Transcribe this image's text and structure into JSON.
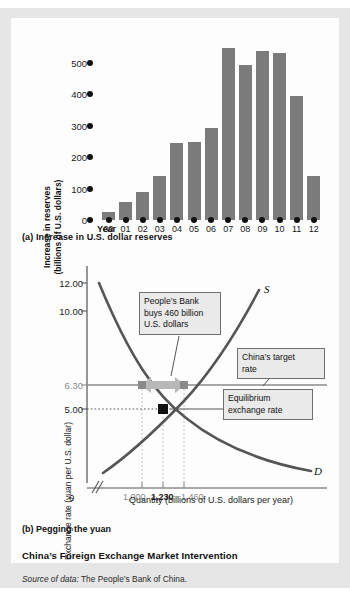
{
  "figure": {
    "title": "China’s Foreign Exchange Market Intervention",
    "source_prefix": "Source of data:",
    "source_text": " The People’s Bank of China.",
    "panel_a_caption": "(a) Increase in U.S. dollar reserves",
    "panel_b_caption": "(b) Pegging the yuan",
    "colors": {
      "bar_fill": "#7b7b7b",
      "curve": "#555555",
      "callout_fill": "#eaeaea",
      "callout_border": "#6f6f6f",
      "arrow_fill": "#b8b8b8",
      "page_frame": "#e6e6e6",
      "card": "#fdfdfd",
      "gray_text": "#8a8a8a"
    }
  },
  "chart_data": [
    {
      "type": "bar",
      "title": "(a) Increase in U.S. dollar reserves",
      "xlabel": "Year",
      "ylabel": "Increase in reserves (billions of U.S. dollars)",
      "ylabel_line1": "Increase in reserves",
      "ylabel_line2": "(billions of U.S. dollars)",
      "categories": [
        "00",
        "01",
        "02",
        "03",
        "04",
        "05",
        "06",
        "07",
        "08",
        "09",
        "10",
        "11",
        "12"
      ],
      "values": [
        22,
        48,
        76,
        118,
        207,
        209,
        247,
        462,
        418,
        454,
        448,
        334,
        118
      ],
      "ylim": [
        0,
        500
      ],
      "yticks": [
        0,
        100,
        200,
        300,
        400,
        500
      ],
      "ytick_labels": [
        "0",
        "100",
        "200",
        "300",
        "400",
        "500"
      ],
      "grid": false,
      "legend": "none"
    },
    {
      "type": "line",
      "title": "(b) Pegging the yuan",
      "xlabel": "Quantity (billions of U.S. dollars per year)",
      "ylabel": "Exchange rate (yuan per U.S. dollar)",
      "yticks": [
        5.0,
        6.3,
        10.0,
        12.0
      ],
      "ytick_labels": [
        "5.00",
        "6.30",
        "10.00",
        "12.00"
      ],
      "xticks": [
        1000,
        1230,
        1460
      ],
      "xtick_labels": [
        "1,000",
        "1,230",
        "1,460"
      ],
      "x_origin_label": "0",
      "series": [
        {
          "name": "S",
          "label": "S",
          "description": "Supply of U.S. dollars, upward sloping",
          "points": [
            [
              1000,
              6.3
            ],
            [
              1230,
              5.0
            ],
            [
              1460,
              6.3
            ]
          ]
        },
        {
          "name": "D",
          "label": "D",
          "description": "Demand for U.S. dollars, downward sloping",
          "points": [
            [
              1000,
              6.3
            ],
            [
              1230,
              5.0
            ],
            [
              1460,
              6.3
            ]
          ]
        }
      ],
      "equilibrium": {
        "quantity": 1230,
        "rate": 5.0,
        "label": "Equilibrium exchange rate"
      },
      "target_rate": {
        "rate": 6.3,
        "label": "China’s target rate"
      },
      "intervention": {
        "label": "People’s Bank buys 460 billion U.S. dollars",
        "line1": "People’s Bank",
        "line2": "buys 460 billion",
        "line3": "U.S. dollars",
        "amount": 460,
        "quantity_low": 1000,
        "quantity_high": 1460
      },
      "annotations": [
        {
          "text": "People’s Bank buys 460 billion U.S. dollars"
        },
        {
          "text": "China’s target rate"
        },
        {
          "text": "Equilibrium exchange rate"
        }
      ],
      "callout_target_line1": "China’s target",
      "callout_target_line2": "rate",
      "callout_equil_line1": "Equilibrium",
      "callout_equil_line2": "exchange rate",
      "grid": false,
      "legend": "inline-curve-labels"
    }
  ]
}
